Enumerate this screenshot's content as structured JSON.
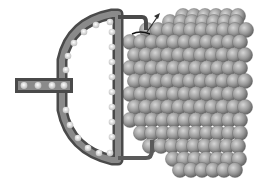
{
  "diagram": {
    "colors": {
      "background": "#ffffff",
      "tube_outer": "#4a4a4a",
      "tube_inner": "#8a8a8a",
      "chain_atom": "#e8e8e8",
      "lattice_atom": "#9a9a9a",
      "lattice_shadow": "#5e5e5e",
      "arrow": "#333333"
    },
    "components": [
      {
        "id": "stem",
        "label": ""
      },
      {
        "id": "d-shaped-tube",
        "label": ""
      },
      {
        "id": "bottom-lead",
        "label": ""
      },
      {
        "id": "atomic-lattice",
        "label": ""
      },
      {
        "id": "motion-arrow",
        "label": ""
      }
    ],
    "lattice": {
      "rows": 11,
      "cols": 8
    }
  }
}
